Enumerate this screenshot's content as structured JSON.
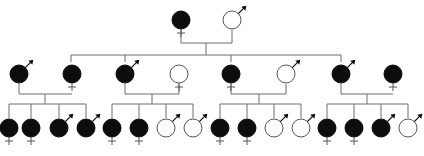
{
  "diagram": {
    "type": "pedigree",
    "colors": {
      "line": "#6e6e6e",
      "affected": "#0d0d0d",
      "unaffected_fill": "#ffffff",
      "outline": "#555555"
    },
    "generations": [
      {
        "id": "gen1",
        "individuals": [
          {
            "id": "I-1",
            "sex": "female",
            "affected": true,
            "x": 181,
            "y": 20
          },
          {
            "id": "I-2",
            "sex": "male",
            "affected": false,
            "x": 232,
            "y": 20
          }
        ]
      },
      {
        "id": "gen2",
        "individuals": [
          {
            "id": "II-1",
            "sex": "male",
            "affected": true,
            "x": 19,
            "y": 74
          },
          {
            "id": "II-2",
            "sex": "female",
            "affected": true,
            "x": 72,
            "y": 74
          },
          {
            "id": "II-3",
            "sex": "male",
            "affected": true,
            "x": 125,
            "y": 74
          },
          {
            "id": "II-4",
            "sex": "female",
            "affected": false,
            "x": 179,
            "y": 74
          },
          {
            "id": "II-5",
            "sex": "female",
            "affected": true,
            "x": 231,
            "y": 74
          },
          {
            "id": "II-6",
            "sex": "male",
            "affected": false,
            "x": 286,
            "y": 74
          },
          {
            "id": "II-7",
            "sex": "male",
            "affected": true,
            "x": 341,
            "y": 74
          },
          {
            "id": "II-8",
            "sex": "female",
            "affected": true,
            "x": 393,
            "y": 74
          }
        ]
      },
      {
        "id": "gen3",
        "individuals": [
          {
            "id": "III-1",
            "sex": "female",
            "affected": true,
            "x": 9,
            "y": 128
          },
          {
            "id": "III-2",
            "sex": "female",
            "affected": true,
            "x": 31,
            "y": 128
          },
          {
            "id": "III-3",
            "sex": "male",
            "affected": true,
            "x": 59,
            "y": 128
          },
          {
            "id": "III-4",
            "sex": "male",
            "affected": true,
            "x": 86,
            "y": 128
          },
          {
            "id": "III-5",
            "sex": "female",
            "affected": true,
            "x": 112,
            "y": 128
          },
          {
            "id": "III-6",
            "sex": "female",
            "affected": true,
            "x": 139,
            "y": 128
          },
          {
            "id": "III-7",
            "sex": "male",
            "affected": false,
            "x": 166,
            "y": 128
          },
          {
            "id": "III-8",
            "sex": "male",
            "affected": false,
            "x": 193,
            "y": 128
          },
          {
            "id": "III-9",
            "sex": "female",
            "affected": true,
            "x": 220,
            "y": 128
          },
          {
            "id": "III-10",
            "sex": "female",
            "affected": true,
            "x": 247,
            "y": 128
          },
          {
            "id": "III-11",
            "sex": "male",
            "affected": false,
            "x": 274,
            "y": 128
          },
          {
            "id": "III-12",
            "sex": "male",
            "affected": false,
            "x": 301,
            "y": 128
          },
          {
            "id": "III-13",
            "sex": "female",
            "affected": true,
            "x": 327,
            "y": 128
          },
          {
            "id": "III-14",
            "sex": "female",
            "affected": true,
            "x": 354,
            "y": 128
          },
          {
            "id": "III-15",
            "sex": "male",
            "affected": true,
            "x": 381,
            "y": 128
          },
          {
            "id": "III-16",
            "sex": "male",
            "affected": false,
            "x": 408,
            "y": 128
          }
        ]
      }
    ],
    "lines": [
      "M181 30 V43 H232 V30",
      "M206 43 V55",
      "M71 55 H341",
      "M71 55 V62",
      "M125 55 V62",
      "M231 55 V62",
      "M341 55 V62",
      "M19 84 V94 H72",
      "M45 94 V104",
      "M9 104 H86",
      "M9 104 V118",
      "M31 104 V118",
      "M59 104 V118",
      "M86 104 V118",
      "M125 84 V94 H179 V84",
      "M152 94 V104",
      "M112 104 H193",
      "M112 104 V118",
      "M139 104 V118",
      "M166 104 V118",
      "M193 104 V118",
      "M231 84 V94 H286 V84",
      "M259 94 V104",
      "M220 104 H301",
      "M220 104 V118",
      "M247 104 V118",
      "M274 104 V118",
      "M301 104 V118",
      "M341 84 V94 H393",
      "M367 94 V104",
      "M327 104 H408",
      "M327 104 V118",
      "M354 104 V118",
      "M381 104 V118",
      "M408 104 V118"
    ]
  }
}
